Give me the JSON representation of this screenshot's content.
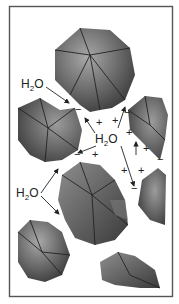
{
  "figure": {
    "type": "schematic",
    "molecule_label": "H2O",
    "molecule_main": "H",
    "molecule_subscript": "2",
    "molecule_tail": "O",
    "labels": [
      {
        "id": "h2o-top-left",
        "text": "H2O"
      },
      {
        "id": "h2o-center",
        "text": "H2O"
      },
      {
        "id": "h2o-lower-left",
        "text": "H2O"
      }
    ],
    "signs": {
      "plus": "+",
      "minus": "−"
    },
    "colors": {
      "frame": "#555555",
      "particle_dark": "#3a3a3a",
      "particle_light": "#9a9a9a",
      "background": "#ffffff"
    }
  }
}
